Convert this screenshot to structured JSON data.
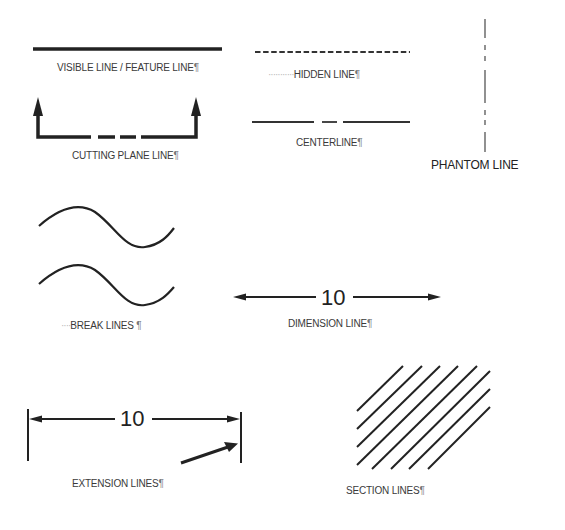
{
  "diagram": {
    "line_color": "#222222",
    "label_color": "#3a3a3a",
    "items": [
      {
        "id": "visible",
        "label": "VISIBLE LINE / FEATURE LINE",
        "mark": "¶"
      },
      {
        "id": "hidden",
        "label": "HIDDEN LINE",
        "mark": "¶",
        "leader": "···········"
      },
      {
        "id": "phantom",
        "label": "PHANTOM LINE",
        "mark": ""
      },
      {
        "id": "cutting-plane",
        "label": "CUTTING PLANE LINE",
        "mark": "¶"
      },
      {
        "id": "center",
        "label": "CENTERLINE",
        "mark": "¶"
      },
      {
        "id": "break",
        "label": "BREAK LINES ",
        "mark": "¶",
        "leader": "····"
      },
      {
        "id": "dimension",
        "label": "DIMENSION LINE",
        "mark": "¶",
        "value": "10"
      },
      {
        "id": "extension",
        "label": "EXTENSION LINES",
        "mark": "¶",
        "value": "10"
      },
      {
        "id": "section",
        "label": "SECTION LINES",
        "mark": "¶"
      }
    ]
  }
}
